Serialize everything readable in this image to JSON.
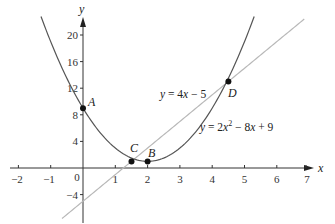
{
  "chart_data": {
    "type": "line",
    "title": "",
    "xlabel": "x",
    "ylabel": "y",
    "xlim": [
      -2,
      7
    ],
    "ylim": [
      -8,
      22
    ],
    "grid": false,
    "x_ticks": [
      -2,
      -1,
      0,
      1,
      2,
      3,
      4,
      5,
      6,
      7
    ],
    "y_ticks": [
      -4,
      4,
      8,
      12,
      16,
      20
    ],
    "series": [
      {
        "name": "y = 2x² − 8x + 9",
        "kind": "parabola",
        "coefficients": {
          "a": 2,
          "b": -8,
          "c": 9
        },
        "x_range": [
          -1.3,
          5.3
        ],
        "color": "#555555"
      },
      {
        "name": "y = 4x − 5",
        "kind": "line",
        "coefficients": {
          "m": 4,
          "b": -5
        },
        "x_range": [
          -0.65,
          6.85
        ],
        "color": "#b8b8b8"
      }
    ],
    "points": [
      {
        "label": "A",
        "x": 0,
        "y": 9
      },
      {
        "label": "B",
        "x": 2,
        "y": 1
      },
      {
        "label": "C",
        "x": 1.5,
        "y": 1
      },
      {
        "label": "D",
        "x": 4.5,
        "y": 13
      }
    ],
    "annotations": [
      {
        "text": "y = 4x − 5",
        "near": "line"
      },
      {
        "text": "y = 2x² − 8x + 9",
        "near": "parabola"
      }
    ]
  },
  "labels": {
    "x_axis": "x",
    "y_axis": "y",
    "origin": "0",
    "line_eq_prefix": "y = 4",
    "line_eq_var": "x",
    "line_eq_suffix": " − 5",
    "parab_eq_prefix": "y",
    "parab_eq_mid1": " = 2",
    "parab_eq_x": "x",
    "parab_eq_sup": "2",
    "parab_eq_mid2": " − 8",
    "parab_eq_x2": "x",
    "parab_eq_end": " + 9",
    "point_A": "A",
    "point_B": "B",
    "point_C": "C",
    "point_D": "D",
    "xtick_m2": "−2",
    "xtick_m1": "−1",
    "xtick_1": "1",
    "xtick_2": "2",
    "xtick_3": "3",
    "xtick_4": "4",
    "xtick_5": "5",
    "xtick_6": "6",
    "xtick_7": "7",
    "ytick_m4": "−4",
    "ytick_4": "4",
    "ytick_8": "8",
    "ytick_12": "12",
    "ytick_16": "16",
    "ytick_20": "20"
  }
}
